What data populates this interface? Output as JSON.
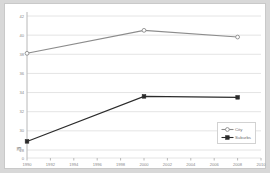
{
  "chart_data": {
    "type": "line",
    "title": "",
    "xlabel": "",
    "ylabel": "",
    "x": [
      1990,
      1992,
      1994,
      1996,
      1998,
      2000,
      2002,
      2004,
      2006,
      2008,
      2010
    ],
    "xtick_labels": [
      "1990",
      "1992",
      "1994",
      "1996",
      "1998",
      "2000",
      "2002",
      "2004",
      "2006",
      "2008",
      "2010"
    ],
    "xlim": [
      1990,
      2010
    ],
    "ytick_labels": [
      "42",
      "40",
      "38",
      "36",
      "34",
      "32",
      "30",
      "28"
    ],
    "yticks": [
      42,
      40,
      38,
      36,
      34,
      32,
      30,
      28
    ],
    "ylim": [
      28,
      42
    ],
    "axis_break_symbol": "≋",
    "zero_label": "0",
    "grid": true,
    "legend_position": "bottom-right",
    "series": [
      {
        "name": "City",
        "color": "#8c8c8c",
        "marker": "open-circle",
        "points": [
          {
            "x": 1990,
            "y": 38.1
          },
          {
            "x": 2000,
            "y": 40.5
          },
          {
            "x": 2008,
            "y": 39.8
          }
        ]
      },
      {
        "name": "Suburbs",
        "color": "#2b2b2b",
        "marker": "filled-square",
        "points": [
          {
            "x": 1990,
            "y": 28.9
          },
          {
            "x": 2000,
            "y": 33.6
          },
          {
            "x": 2008,
            "y": 33.5
          }
        ]
      }
    ]
  }
}
